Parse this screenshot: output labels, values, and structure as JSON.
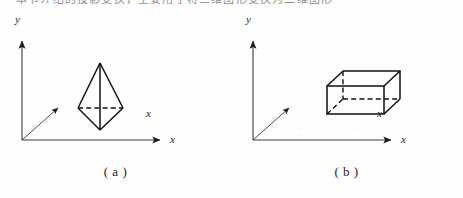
{
  "page": {
    "width": 463,
    "height": 198,
    "background_color": "#fefefe",
    "ink_color": "#1c1c1c",
    "top_cut_text": "本节介绍的投影变换，主要用于将三维图形变换为二维图形"
  },
  "figures": [
    {
      "id": "figure-a",
      "caption": "( a )",
      "shape_name": "tetrahedron",
      "axes": {
        "y_label": "y",
        "x_label": "x",
        "z_label": "x",
        "origin": {
          "x": 22,
          "y": 131
        },
        "y_axis_end": {
          "x": 22,
          "y": 30
        },
        "x_axis_end": {
          "x": 162,
          "y": 131
        },
        "z_axis_end": {
          "x": 60,
          "y": 97
        }
      },
      "label_positions": {
        "y": {
          "x": 15,
          "y": 7
        },
        "x": {
          "x": 172,
          "y": 126
        },
        "z": {
          "x": 148,
          "y": 101
        }
      },
      "solid_vertices": {
        "apex_top": {
          "x": 100,
          "y": 54
        },
        "bottom": {
          "x": 100,
          "y": 121
        },
        "left": {
          "x": 78,
          "y": 99
        },
        "right": {
          "x": 123,
          "y": 99
        }
      },
      "hidden_edge": "left-right horizontal dashed"
    },
    {
      "id": "figure-b",
      "caption": "( b )",
      "shape_name": "cuboid",
      "axes": {
        "y_label": "y",
        "x_label": "x",
        "z_label": "x",
        "origin": {
          "x": 22,
          "y": 131
        },
        "y_axis_end": {
          "x": 22,
          "y": 30
        },
        "x_axis_end": {
          "x": 162,
          "y": 131
        },
        "z_axis_end": {
          "x": 60,
          "y": 97
        }
      },
      "label_positions": {
        "y": {
          "x": 15,
          "y": 7
        },
        "x": {
          "x": 172,
          "y": 126
        },
        "z": {
          "x": 148,
          "y": 101
        }
      },
      "solid_vertices": {
        "front_top_left": {
          "x": 96,
          "y": 77
        },
        "front_top_right": {
          "x": 153,
          "y": 77
        },
        "front_bottom_left": {
          "x": 96,
          "y": 105
        },
        "front_bottom_right": {
          "x": 153,
          "y": 105
        },
        "back_top_left": {
          "x": 112,
          "y": 62
        },
        "back_top_right": {
          "x": 169,
          "y": 62
        },
        "back_bottom_left": {
          "x": 112,
          "y": 90
        },
        "back_bottom_right": {
          "x": 169,
          "y": 90
        }
      },
      "hidden_edges": "back-bottom-left vertical and bottom horizontals dashed"
    }
  ]
}
